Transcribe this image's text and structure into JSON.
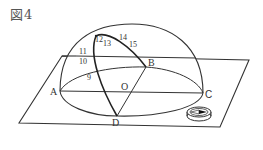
{
  "figure": {
    "title": "図4"
  },
  "points": {
    "A": "A",
    "B": "B",
    "C": "C",
    "D": "D",
    "O": "O"
  },
  "hour_marks": [
    "9",
    "10",
    "11",
    "12",
    "13",
    "14",
    "15"
  ],
  "objects": {
    "plane": "horizontal-board",
    "hemisphere": "transparent-hemisphere",
    "compass": "compass-icon",
    "sun_path": "sun-path-curve"
  },
  "colors": {
    "line": "#333333",
    "background": "#ffffff"
  }
}
